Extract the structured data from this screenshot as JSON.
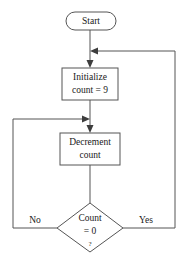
{
  "diagram": {
    "type": "flowchart",
    "background_color": "#ffffff",
    "line_color": "#555555",
    "arrow_color": "#3d3d3d",
    "text_color": "#1a1a1a"
  },
  "nodes": {
    "start": {
      "shape": "stadium",
      "label": "Start"
    },
    "initialize": {
      "shape": "rectangle",
      "line1": "Initialize",
      "line2": "count = 9"
    },
    "decrement": {
      "shape": "rectangle",
      "line1": "Decrement",
      "line2": "count"
    },
    "decision": {
      "shape": "diamond",
      "line1": "Count",
      "line2": "= 0",
      "line3": "?"
    }
  },
  "branches": {
    "no_label": "No",
    "yes_label": "Yes"
  }
}
